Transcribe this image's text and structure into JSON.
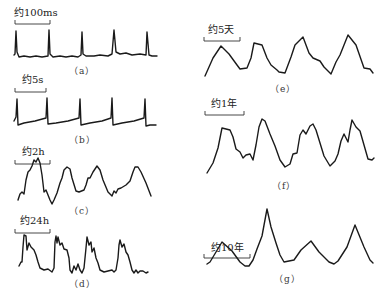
{
  "figure": {
    "panels": [
      {
        "id": "a",
        "scale_label": "约100ms",
        "caption": "（a）"
      },
      {
        "id": "b",
        "scale_label": "约5s",
        "caption": "（b）"
      },
      {
        "id": "c",
        "scale_label": "约2h",
        "caption": "（c）"
      },
      {
        "id": "d",
        "scale_label": "约24h",
        "caption": "（d）"
      },
      {
        "id": "e",
        "scale_label": "约5天",
        "caption": "（e）"
      },
      {
        "id": "f",
        "scale_label": "约1年",
        "caption": "（f）"
      },
      {
        "id": "g",
        "scale_label": "约10年",
        "caption": "（g）"
      }
    ]
  },
  "colors": {
    "line": "#1a1a1a",
    "background": "#ffffff"
  }
}
